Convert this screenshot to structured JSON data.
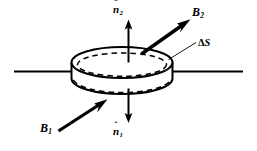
{
  "figure": {
    "background_color": "#ffffff",
    "ink_color": "#000000",
    "labels": {
      "normal_upper": {
        "symbol": "n",
        "hat": "ˆ",
        "subscript": "2",
        "full": "n̂2"
      },
      "normal_lower": {
        "symbol": "n",
        "hat": "ˆ",
        "subscript": "1",
        "full": "n̂1"
      },
      "field_upper": {
        "symbol": "B",
        "subscript": "2",
        "full": "B2"
      },
      "field_lower": {
        "symbol": "B",
        "subscript": "1",
        "full": "B1"
      },
      "area_element": {
        "delta": "Δ",
        "symbol": "S",
        "full": "ΔS"
      }
    },
    "elements": [
      {
        "name": "interface-line-left",
        "kind": "line"
      },
      {
        "name": "interface-line-right",
        "kind": "line"
      },
      {
        "name": "pillbox-top-ellipse",
        "kind": "ellipse-solid"
      },
      {
        "name": "pillbox-inner-dashed-ellipse",
        "kind": "ellipse-dashed"
      },
      {
        "name": "pillbox-side-wall",
        "kind": "cylinder-wall"
      },
      {
        "name": "pillbox-bottom-dashed-arc",
        "kind": "arc-dashed"
      },
      {
        "name": "normal-arrow-up",
        "kind": "arrow"
      },
      {
        "name": "normal-arrow-down",
        "kind": "arrow"
      },
      {
        "name": "field-arrow-upper",
        "kind": "thick-arrow"
      },
      {
        "name": "field-arrow-lower",
        "kind": "thick-arrow"
      },
      {
        "name": "area-leader-line",
        "kind": "leader"
      }
    ]
  }
}
